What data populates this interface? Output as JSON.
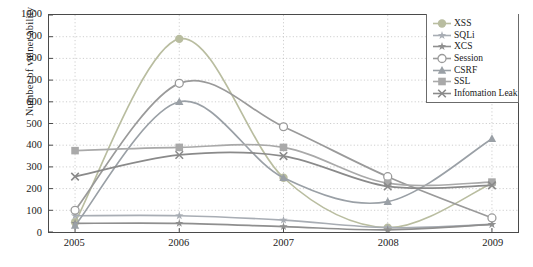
{
  "chart_data": {
    "type": "line",
    "title": "",
    "xlabel": "",
    "ylabel": "Number of vulner ability",
    "categories": [
      "2005",
      "2006",
      "2007",
      "2008",
      "2009"
    ],
    "x": [
      2005,
      2006,
      2007,
      2008,
      2009
    ],
    "xlim": [
      2004.75,
      2009.25
    ],
    "ylim": [
      0,
      1000
    ],
    "yticks": [
      "0",
      "100",
      "200",
      "300",
      "400",
      "500",
      "600",
      "700",
      "800",
      "900",
      "1000"
    ],
    "ytick_values": [
      0,
      100,
      200,
      300,
      400,
      500,
      600,
      700,
      800,
      900,
      1000
    ],
    "grid": "dotted-both",
    "legend_position": "top-right",
    "smoothing": "spline",
    "series": [
      {
        "name": "XSS",
        "marker": "filled-circle",
        "color": "#b9bda0",
        "values": [
          45,
          890,
          250,
          20,
          225
        ]
      },
      {
        "name": "SQLi",
        "marker": "star",
        "color": "#a8adb4",
        "values": [
          75,
          75,
          55,
          20,
          35
        ]
      },
      {
        "name": "XCS",
        "marker": "star",
        "color": "#8f8f8f",
        "values": [
          40,
          40,
          25,
          10,
          35
        ]
      },
      {
        "name": "Session",
        "marker": "open-circle",
        "color": "#9a9a9a",
        "values": [
          100,
          685,
          485,
          255,
          65
        ]
      },
      {
        "name": "CSRF",
        "marker": "triangle",
        "color": "#9aa0a6",
        "values": [
          30,
          600,
          250,
          140,
          430
        ]
      },
      {
        "name": "SSL",
        "marker": "square",
        "color": "#a9a9a9",
        "values": [
          375,
          390,
          390,
          225,
          230
        ]
      },
      {
        "name": "Infomation Leak",
        "marker": "x-cross",
        "color": "#8a8a8a",
        "values": [
          255,
          355,
          350,
          210,
          215
        ]
      }
    ]
  },
  "legend": {
    "items": [
      {
        "label": "XSS"
      },
      {
        "label": "SQLi"
      },
      {
        "label": "XCS"
      },
      {
        "label": "Session"
      },
      {
        "label": "CSRF"
      },
      {
        "label": "SSL"
      },
      {
        "label": "Infomation Leak"
      }
    ]
  },
  "colors": {
    "axis": "#4a4a4a",
    "grid": "#b9b9b9",
    "text": "#1a1a1a",
    "background": "#ffffff"
  }
}
